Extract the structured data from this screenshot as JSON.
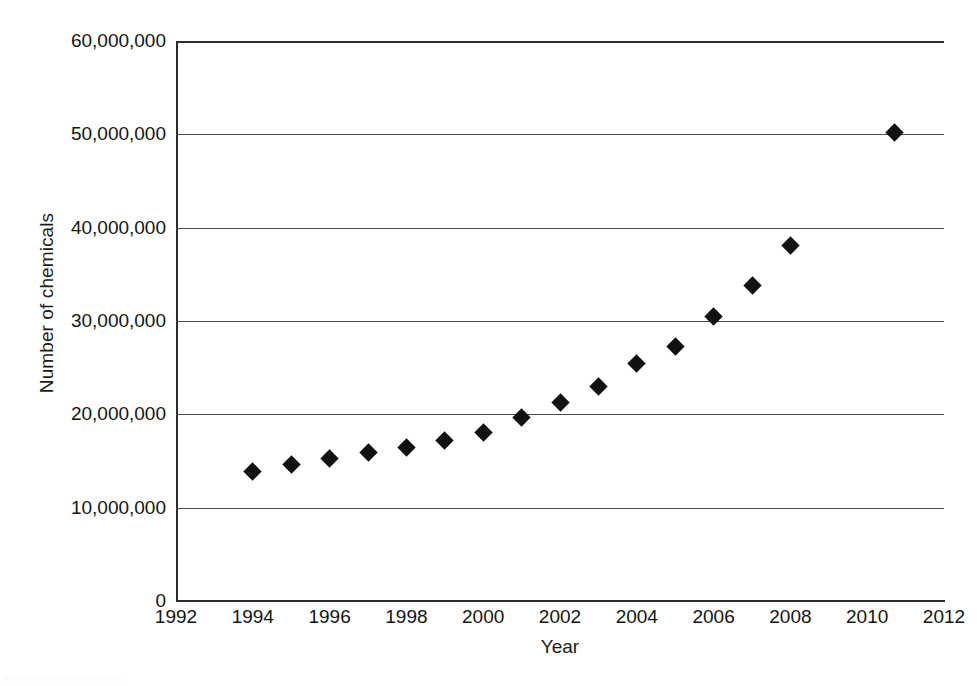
{
  "chart_data": {
    "type": "scatter",
    "title": "",
    "xlabel": "Year",
    "ylabel": "Number of chemicals",
    "xlim": [
      1992,
      2012
    ],
    "ylim": [
      0,
      60000000
    ],
    "grid": "horizontal",
    "legend": "none",
    "marker": "filled-diamond",
    "marker_color": "#111111",
    "x_ticks": [
      1992,
      1994,
      1996,
      1998,
      2000,
      2002,
      2004,
      2006,
      2008,
      2010,
      2012
    ],
    "x_tick_labels": [
      "1992",
      "1994",
      "1996",
      "1998",
      "2000",
      "2002",
      "2004",
      "2006",
      "2008",
      "2010",
      "2012"
    ],
    "y_ticks": [
      0,
      10000000,
      20000000,
      30000000,
      40000000,
      50000000,
      60000000
    ],
    "y_tick_labels": [
      "0",
      "10,000,000",
      "20,000,000",
      "30,000,000",
      "40,000,000",
      "50,000,000",
      "60,000,000"
    ],
    "series": [
      {
        "name": "Number of chemicals",
        "points": [
          {
            "x": 1994,
            "y": 13900000
          },
          {
            "x": 1995,
            "y": 14600000
          },
          {
            "x": 1996,
            "y": 15300000
          },
          {
            "x": 1997,
            "y": 15900000
          },
          {
            "x": 1998,
            "y": 16400000
          },
          {
            "x": 1999,
            "y": 17200000
          },
          {
            "x": 2000,
            "y": 18100000
          },
          {
            "x": 2001,
            "y": 19700000
          },
          {
            "x": 2002,
            "y": 21300000
          },
          {
            "x": 2003,
            "y": 23000000
          },
          {
            "x": 2004,
            "y": 25400000
          },
          {
            "x": 2005,
            "y": 27300000
          },
          {
            "x": 2006,
            "y": 30500000
          },
          {
            "x": 2007,
            "y": 33800000
          },
          {
            "x": 2008,
            "y": 38100000
          },
          {
            "x": 2010.7,
            "y": 50200000
          }
        ]
      }
    ]
  },
  "axes": {
    "y_title": "Number of chemicals",
    "x_title": "Year"
  }
}
